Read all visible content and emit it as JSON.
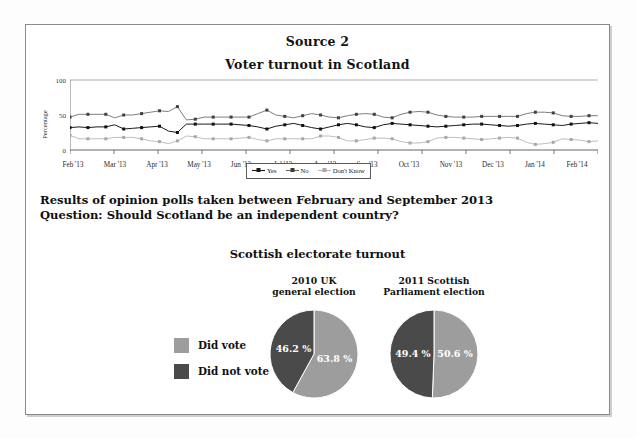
{
  "document": {
    "source_title": "Source 2",
    "chart_title": "Voter turnout in Scotland",
    "poll_line_1": "Results of opinion polls taken between February and September 2013",
    "poll_line_2": "Question: Should Scotland be an independent country?"
  },
  "colors": {
    "yes_line": "#1a1a1a",
    "no_line": "#6e6e6e",
    "dont_know_line": "#b5b5b5",
    "did_vote": "#9d9d9d",
    "did_not_vote": "#4a4a4a",
    "axis": "#555555",
    "frame_border": "#8a8a8a"
  },
  "chart_data": [
    {
      "type": "line",
      "title": "Voter turnout in Scotland",
      "xlabel": "",
      "ylabel": "Percentage",
      "ylim": [
        0,
        100
      ],
      "yticks": [
        0,
        50,
        100
      ],
      "grid": false,
      "legend_position": "bottom-center",
      "categories": [
        "Feb '13",
        "Mar '13",
        "Apr '13",
        "May '13",
        "Jun '13",
        "Jul '13",
        "Aug '13",
        "Sep '13",
        "Oct '13",
        "Nov '13",
        "Dec '13",
        "Jan '14",
        "Feb '14"
      ],
      "series": [
        {
          "name": "Yes",
          "color": "#1a1a1a",
          "values": [
            32,
            33,
            32,
            33,
            33,
            36,
            30,
            31,
            32,
            33,
            34,
            27,
            25,
            37,
            37,
            37,
            37,
            37,
            37,
            36,
            35,
            33,
            30,
            34,
            36,
            38,
            35,
            32,
            30,
            33,
            36,
            38,
            36,
            33,
            32,
            36,
            38,
            37,
            36,
            35,
            34,
            33,
            34,
            35,
            36,
            37,
            37,
            36,
            35,
            34,
            35,
            37,
            38,
            37,
            36,
            35,
            37,
            38,
            39,
            38
          ]
        },
        {
          "name": "No",
          "color": "#6e6e6e",
          "values": [
            47,
            51,
            51,
            51,
            51,
            46,
            50,
            50,
            52,
            54,
            56,
            55,
            62,
            43,
            44,
            47,
            47,
            47,
            47,
            47,
            47,
            52,
            57,
            50,
            48,
            46,
            49,
            52,
            50,
            47,
            46,
            49,
            51,
            52,
            51,
            47,
            46,
            51,
            54,
            55,
            54,
            50,
            48,
            47,
            47,
            47,
            48,
            48,
            48,
            48,
            48,
            52,
            54,
            54,
            53,
            49,
            48,
            48,
            49,
            49
          ]
        },
        {
          "name": "Don't Know",
          "color": "#b5b5b5",
          "values": [
            21,
            16,
            16,
            16,
            16,
            18,
            18,
            18,
            16,
            13,
            12,
            9,
            13,
            20,
            19,
            16,
            16,
            16,
            16,
            17,
            18,
            15,
            13,
            16,
            16,
            16,
            16,
            16,
            20,
            20,
            18,
            13,
            13,
            15,
            17,
            17,
            16,
            12,
            10,
            10,
            12,
            17,
            18,
            18,
            17,
            16,
            15,
            16,
            17,
            18,
            17,
            11,
            8,
            9,
            11,
            16,
            15,
            14,
            12,
            13
          ]
        }
      ],
      "legend": [
        "Yes",
        "No",
        "Don't Know"
      ]
    },
    {
      "type": "pie",
      "title": "Scottish electorate turnout",
      "legend": [
        "Did vote",
        "Did not vote"
      ],
      "legend_position": "left",
      "pies": [
        {
          "caption_line_1": "2010 UK",
          "caption_line_2": "general election",
          "labels": [
            "Did vote",
            "Did not vote"
          ],
          "values": [
            63.8,
            46.2
          ],
          "value_labels": [
            "63.8 %",
            "46.2 %"
          ]
        },
        {
          "caption_line_1": "2011 Scottish",
          "caption_line_2": "Parliament election",
          "labels": [
            "Did vote",
            "Did not vote"
          ],
          "values": [
            50.6,
            49.4
          ],
          "value_labels": [
            "50.6 %",
            "49.4 %"
          ]
        }
      ]
    }
  ]
}
